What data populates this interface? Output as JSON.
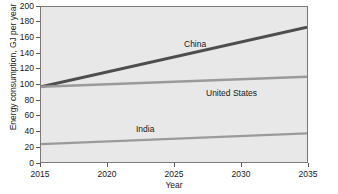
{
  "chart_data": {
    "type": "line",
    "title": "",
    "xlabel": "Year",
    "ylabel": "Energy consumption, GJ per year",
    "xlim": [
      2015,
      2035
    ],
    "ylim": [
      0,
      200
    ],
    "xticks": [
      2015,
      2020,
      2025,
      2030,
      2035
    ],
    "yticks": [
      0,
      20,
      40,
      60,
      80,
      100,
      120,
      140,
      160,
      180,
      200
    ],
    "grid": false,
    "legend_position": "inline-annotations",
    "x": [
      2015,
      2035
    ],
    "series": [
      {
        "name": "China",
        "values": [
          97,
          174
        ],
        "color": "#4d4d4d",
        "label_x": 2028,
        "label_y": 148
      },
      {
        "name": "United States",
        "values": [
          97,
          110
        ],
        "color": "#9a9a9a",
        "label_x": 2031,
        "label_y": 95
      },
      {
        "name": "India",
        "values": [
          23,
          37
        ],
        "color": "#9a9a9a",
        "label_x": 2023,
        "label_y": 48
      }
    ],
    "colors": {
      "plot_background": "#e8e8e8",
      "frame": "#7a7a7a",
      "text": "#1a1a1a",
      "china_line": "#4d4d4d",
      "united_states_line": "#9a9a9a",
      "india_line": "#9a9a9a"
    }
  }
}
